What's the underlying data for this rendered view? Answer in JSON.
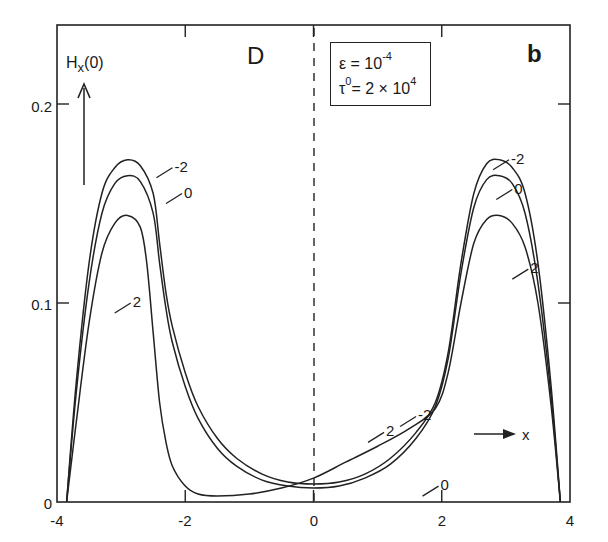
{
  "chart_data": {
    "type": "line",
    "panel_label": "b",
    "region_label": "D",
    "title": "",
    "xlabel": "x",
    "ylabel": "H_x(0)",
    "xlim": [
      -4,
      4
    ],
    "ylim": [
      0,
      0.24
    ],
    "x_ticks": [
      -4,
      -2,
      0,
      2,
      4
    ],
    "x_tick_labels": [
      "-4",
      "-2",
      "0",
      "2",
      "4"
    ],
    "y_ticks": [
      0,
      0.1,
      0.2
    ],
    "y_tick_labels": [
      "0",
      "0.1",
      "0.2"
    ],
    "grid": false,
    "legend": "none (curves labeled inline)",
    "annotation": {
      "epsilon": "ε = 10",
      "epsilon_exp": "-4",
      "tau": "τ",
      "tau_sup": "0",
      "tau_rest": "= 2 × 10",
      "tau_exp": "4"
    },
    "vertical_dashed_line_x": 0,
    "series": [
      {
        "name": "-2",
        "x": [
          -3.85,
          -3.7,
          -3.5,
          -3.3,
          -3.1,
          -2.9,
          -2.7,
          -2.5,
          -2.4,
          -2.3,
          -2.2,
          -2.0,
          -1.8,
          -1.5,
          -1.2,
          -0.8,
          -0.4,
          0,
          0.4,
          0.8,
          1.2,
          1.6,
          1.9,
          2.1,
          2.3,
          2.5,
          2.7,
          2.9,
          3.1,
          3.3,
          3.5,
          3.7,
          3.85
        ],
        "y": [
          0.0,
          0.06,
          0.12,
          0.155,
          0.168,
          0.172,
          0.169,
          0.155,
          0.13,
          0.105,
          0.088,
          0.065,
          0.048,
          0.032,
          0.022,
          0.014,
          0.01,
          0.009,
          0.01,
          0.014,
          0.022,
          0.035,
          0.05,
          0.075,
          0.12,
          0.155,
          0.17,
          0.172,
          0.168,
          0.155,
          0.12,
          0.06,
          0.0
        ]
      },
      {
        "name": "0",
        "x": [
          -3.85,
          -3.7,
          -3.5,
          -3.3,
          -3.1,
          -2.9,
          -2.7,
          -2.5,
          -2.4,
          -2.3,
          -2.2,
          -2.0,
          -1.8,
          -1.5,
          -1.2,
          -0.8,
          -0.4,
          0,
          0.4,
          0.8,
          1.2,
          1.6,
          1.9,
          2.1,
          2.3,
          2.5,
          2.7,
          2.9,
          3.1,
          3.3,
          3.5,
          3.7,
          3.85
        ],
        "y": [
          0.0,
          0.055,
          0.11,
          0.145,
          0.16,
          0.164,
          0.161,
          0.145,
          0.12,
          0.097,
          0.08,
          0.058,
          0.042,
          0.027,
          0.018,
          0.011,
          0.008,
          0.007,
          0.008,
          0.012,
          0.019,
          0.032,
          0.048,
          0.072,
          0.115,
          0.148,
          0.162,
          0.164,
          0.16,
          0.145,
          0.11,
          0.055,
          0.0
        ]
      },
      {
        "name": "2",
        "x": [
          -3.85,
          -3.7,
          -3.5,
          -3.3,
          -3.1,
          -2.9,
          -2.7,
          -2.6,
          -2.5,
          -2.4,
          -2.3,
          -2.2,
          -2.0,
          -1.8,
          -1.5,
          -1.0,
          -0.5,
          0,
          0.5,
          1.0,
          1.5,
          1.9,
          2.1,
          2.3,
          2.5,
          2.7,
          2.9,
          3.1,
          3.3,
          3.5,
          3.7,
          3.85
        ],
        "y": [
          0.0,
          0.04,
          0.09,
          0.125,
          0.14,
          0.144,
          0.138,
          0.12,
          0.085,
          0.05,
          0.03,
          0.018,
          0.008,
          0.004,
          0.003,
          0.004,
          0.007,
          0.012,
          0.02,
          0.028,
          0.037,
          0.047,
          0.065,
          0.1,
          0.13,
          0.142,
          0.144,
          0.14,
          0.128,
          0.1,
          0.05,
          0.0
        ]
      }
    ],
    "curve_labels": [
      {
        "text": "-2",
        "x": -2.2,
        "y": 0.168
      },
      {
        "text": "0",
        "x": -2.05,
        "y": 0.155
      },
      {
        "text": "2",
        "x": -2.85,
        "y": 0.1
      },
      {
        "text": "-2",
        "x": 3.05,
        "y": 0.172
      },
      {
        "text": "0",
        "x": 3.1,
        "y": 0.157
      },
      {
        "text": "2",
        "x": 3.35,
        "y": 0.117
      },
      {
        "text": "2",
        "x": 1.1,
        "y": 0.035
      },
      {
        "text": "-2",
        "x": 1.6,
        "y": 0.043
      },
      {
        "text": "0",
        "x": 1.95,
        "y": 0.008
      }
    ]
  }
}
